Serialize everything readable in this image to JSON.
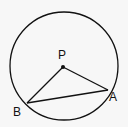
{
  "diagram": {
    "type": "circle-geometry",
    "circle": {
      "cx": 64,
      "cy": 66,
      "r": 54
    },
    "points": {
      "P": {
        "label": "P",
        "x": 63,
        "y": 67,
        "label_x": 58,
        "label_y": 59
      },
      "A": {
        "label": "A",
        "x": 108,
        "y": 90,
        "label_x": 109,
        "label_y": 101
      },
      "B": {
        "label": "B",
        "x": 27,
        "y": 103,
        "label_x": 13,
        "label_y": 116
      }
    },
    "segments": [
      [
        "P",
        "A"
      ],
      [
        "P",
        "B"
      ],
      [
        "B",
        "A"
      ]
    ],
    "stroke_color": "#111111"
  }
}
